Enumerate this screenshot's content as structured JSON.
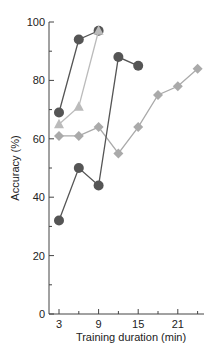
{
  "chart_data": {
    "type": "line",
    "title": "",
    "xlabel": "Training duration (min)",
    "ylabel": "Accuracy (%)",
    "xlim": [
      0,
      25
    ],
    "ylim": [
      0,
      100
    ],
    "xticks": [
      3,
      9,
      15,
      21
    ],
    "yticks": [
      0,
      20,
      40,
      60,
      80,
      100
    ],
    "grid": false,
    "legend": null,
    "series": [
      {
        "name": "Series A (dark circles)",
        "marker": "circle",
        "color": "#555555",
        "x": [
          3,
          6,
          9
        ],
        "y": [
          69,
          94,
          97
        ]
      },
      {
        "name": "Series B (light triangles)",
        "marker": "triangle",
        "color": "#bbbbbb",
        "x": [
          3,
          6,
          9
        ],
        "y": [
          65,
          71,
          97
        ]
      },
      {
        "name": "Series C (light diamonds)",
        "marker": "diamond",
        "color": "#aaaaaa",
        "x": [
          3,
          6,
          9,
          12,
          15,
          18,
          21,
          24
        ],
        "y": [
          61,
          61,
          64,
          55,
          64,
          75,
          78,
          84
        ]
      },
      {
        "name": "Series D (dark circles)",
        "marker": "circle",
        "color": "#555555",
        "x": [
          3,
          6,
          9,
          12,
          15
        ],
        "y": [
          32,
          50,
          44,
          88,
          85
        ]
      }
    ]
  }
}
